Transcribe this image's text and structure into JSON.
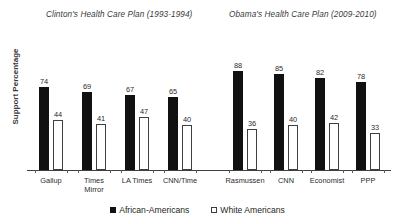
{
  "chart_data": {
    "type": "bar",
    "title": "",
    "xlabel": "",
    "ylabel": "Support Percentage",
    "ylim": [
      0,
      100
    ],
    "grid": false,
    "legend_position": "bottom-center",
    "panels": [
      {
        "title": "Clinton's Health Care Plan (1993-1994)",
        "categories": [
          "Gallup",
          "Times\nMirror",
          "LA Times",
          "CNN/Time"
        ],
        "series": [
          {
            "name": "African-Americans",
            "values": [
              74,
              69,
              67,
              65
            ]
          },
          {
            "name": "White Americans",
            "values": [
              44,
              41,
              47,
              40
            ]
          }
        ]
      },
      {
        "title": "Obama's Health Care Plan (2009-2010)",
        "categories": [
          "Rasmussen",
          "CNN",
          "Economist",
          "PPP"
        ],
        "series": [
          {
            "name": "African-Americans",
            "values": [
              88,
              85,
              82,
              78
            ]
          },
          {
            "name": "White Americans",
            "values": [
              36,
              40,
              42,
              33
            ]
          }
        ]
      }
    ],
    "legend": [
      {
        "label": "African-Americans",
        "marker": "filled-square",
        "color": "#111111"
      },
      {
        "label": "White Americans",
        "marker": "outline-square",
        "color": "#ffffff"
      }
    ]
  },
  "colors": {
    "african_americans": "#111111",
    "white_americans": "#ffffff",
    "axis": "#3f3f3f",
    "text": "#231f20",
    "background": "#ffffff"
  }
}
